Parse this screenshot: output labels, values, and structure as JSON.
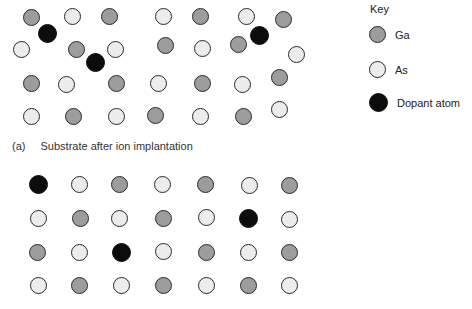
{
  "key": {
    "title": "Key",
    "items": [
      {
        "type": "ga",
        "label": "Ga"
      },
      {
        "type": "as",
        "label": "As"
      },
      {
        "type": "dopant",
        "label": "Dopant atom"
      }
    ]
  },
  "caption": {
    "tag": "(a)",
    "text": "Substrate after ion implantation"
  },
  "colors": {
    "ga": "#a9a9a9",
    "as": "#ececec",
    "dopant": "#0c0c0c",
    "outline": "#2a2a2a"
  },
  "lattice_a": [
    {
      "t": "ga",
      "x": 31,
      "y": 17
    },
    {
      "t": "as",
      "x": 72,
      "y": 16
    },
    {
      "t": "ga",
      "x": 109,
      "y": 16
    },
    {
      "t": "as",
      "x": 163,
      "y": 16
    },
    {
      "t": "ga",
      "x": 200,
      "y": 16
    },
    {
      "t": "as",
      "x": 246,
      "y": 16
    },
    {
      "t": "ga",
      "x": 283,
      "y": 19
    },
    {
      "t": "dopant",
      "x": 47,
      "y": 33
    },
    {
      "t": "dopant",
      "x": 259,
      "y": 35
    },
    {
      "t": "as",
      "x": 21,
      "y": 49
    },
    {
      "t": "ga",
      "x": 76,
      "y": 49
    },
    {
      "t": "as",
      "x": 115,
      "y": 49
    },
    {
      "t": "ga",
      "x": 165,
      "y": 45
    },
    {
      "t": "as",
      "x": 202,
      "y": 48
    },
    {
      "t": "ga",
      "x": 238,
      "y": 44
    },
    {
      "t": "as",
      "x": 296,
      "y": 54
    },
    {
      "t": "dopant",
      "x": 95,
      "y": 62
    },
    {
      "t": "ga",
      "x": 31,
      "y": 83
    },
    {
      "t": "as",
      "x": 66,
      "y": 84
    },
    {
      "t": "ga",
      "x": 116,
      "y": 83
    },
    {
      "t": "as",
      "x": 158,
      "y": 83
    },
    {
      "t": "ga",
      "x": 202,
      "y": 83
    },
    {
      "t": "as",
      "x": 242,
      "y": 84
    },
    {
      "t": "ga",
      "x": 279,
      "y": 77
    },
    {
      "t": "as",
      "x": 31,
      "y": 116
    },
    {
      "t": "ga",
      "x": 73,
      "y": 116
    },
    {
      "t": "as",
      "x": 116,
      "y": 116
    },
    {
      "t": "ga",
      "x": 155,
      "y": 115
    },
    {
      "t": "as",
      "x": 200,
      "y": 116
    },
    {
      "t": "ga",
      "x": 243,
      "y": 116
    },
    {
      "t": "as",
      "x": 279,
      "y": 109
    }
  ],
  "lattice_b": [
    {
      "t": "dopant",
      "x": 38,
      "y": 184
    },
    {
      "t": "as",
      "x": 79,
      "y": 184
    },
    {
      "t": "ga",
      "x": 119,
      "y": 184
    },
    {
      "t": "as",
      "x": 162,
      "y": 184
    },
    {
      "t": "ga",
      "x": 205,
      "y": 184
    },
    {
      "t": "as",
      "x": 249,
      "y": 185
    },
    {
      "t": "ga",
      "x": 289,
      "y": 185
    },
    {
      "t": "as",
      "x": 38,
      "y": 218
    },
    {
      "t": "ga",
      "x": 80,
      "y": 218
    },
    {
      "t": "as",
      "x": 119,
      "y": 218
    },
    {
      "t": "ga",
      "x": 163,
      "y": 218
    },
    {
      "t": "as",
      "x": 206,
      "y": 217
    },
    {
      "t": "dopant",
      "x": 248,
      "y": 218
    },
    {
      "t": "as",
      "x": 289,
      "y": 219
    },
    {
      "t": "ga",
      "x": 37,
      "y": 252
    },
    {
      "t": "as",
      "x": 79,
      "y": 252
    },
    {
      "t": "dopant",
      "x": 121,
      "y": 252
    },
    {
      "t": "as",
      "x": 163,
      "y": 251
    },
    {
      "t": "ga",
      "x": 206,
      "y": 252
    },
    {
      "t": "as",
      "x": 248,
      "y": 252
    },
    {
      "t": "ga",
      "x": 289,
      "y": 252
    },
    {
      "t": "as",
      "x": 38,
      "y": 285
    },
    {
      "t": "ga",
      "x": 79,
      "y": 285
    },
    {
      "t": "as",
      "x": 121,
      "y": 285
    },
    {
      "t": "ga",
      "x": 163,
      "y": 285
    },
    {
      "t": "as",
      "x": 206,
      "y": 285
    },
    {
      "t": "ga",
      "x": 248,
      "y": 285
    },
    {
      "t": "as",
      "x": 289,
      "y": 285
    }
  ]
}
